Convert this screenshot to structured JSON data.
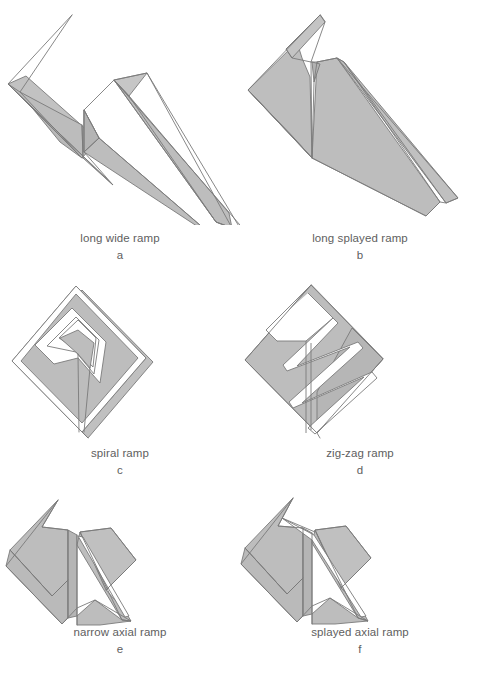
{
  "figure": {
    "background_color": "#ffffff",
    "fill_color": "#bdbdbd",
    "fill_color_light": "#cccccc",
    "fill_color_dark": "#ababab",
    "stroke_color": "#7a7a7a",
    "caption_color": "#5e5e5e",
    "columns": 2,
    "rows": 3
  },
  "panels": [
    {
      "id": "a",
      "letter": "a",
      "name": "long wide ramp",
      "shape": "long-wide-ramp"
    },
    {
      "id": "b",
      "letter": "b",
      "name": "long splayed ramp",
      "shape": "long-splayed-ramp"
    },
    {
      "id": "c",
      "letter": "c",
      "name": "spiral ramp",
      "shape": "spiral-ramp"
    },
    {
      "id": "d",
      "letter": "d",
      "name": "zig-zag ramp",
      "shape": "zig-zag-ramp"
    },
    {
      "id": "e",
      "letter": "e",
      "name": "narrow axial ramp",
      "shape": "narrow-axial-ramp"
    },
    {
      "id": "f",
      "letter": "f",
      "name": "splayed axial ramp",
      "shape": "splayed-axial-ramp"
    }
  ]
}
